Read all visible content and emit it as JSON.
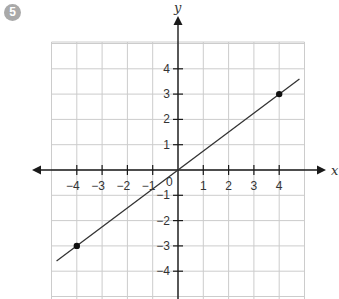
{
  "problem_number": "5",
  "chart_data": {
    "type": "line",
    "title": "",
    "xlabel": "x",
    "ylabel": "y",
    "xlim": [
      -5,
      5
    ],
    "ylim": [
      -5,
      5
    ],
    "grid": true,
    "x_ticks": [
      -4,
      -3,
      -2,
      -1,
      1,
      2,
      3,
      4
    ],
    "y_ticks": [
      -4,
      -3,
      -2,
      -1,
      1,
      2,
      3,
      4
    ],
    "origin_label": "0",
    "series": [
      {
        "name": "line",
        "equation": "y = 0.75x",
        "x": [
          -4,
          4
        ],
        "y": [
          -3,
          3
        ],
        "line_extent_x": [
          -4.8,
          4.8
        ],
        "marked_points": [
          [
            -4,
            -3
          ],
          [
            4,
            3
          ]
        ]
      }
    ],
    "colors": {
      "grid": "#cccccc",
      "axis": "#1a1a1a",
      "line": "#333333",
      "badge": "#a9a9a9"
    }
  }
}
